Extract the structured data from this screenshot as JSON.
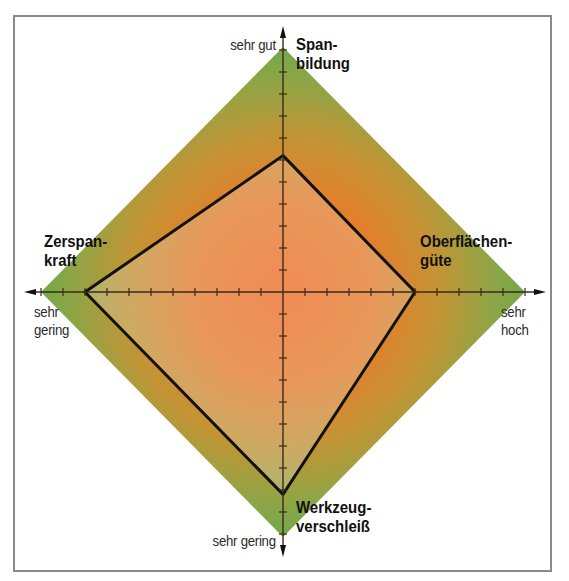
{
  "chart_data": {
    "type": "radar",
    "title": "",
    "scale_max_ticks": 11,
    "axes": [
      {
        "key": "top",
        "name_line1": "Span-",
        "name_line2": "bildung",
        "end_label": "sehr gut",
        "value": 6.2
      },
      {
        "key": "right",
        "name_line1": "Oberflächen-",
        "name_line2": "güte",
        "end_label_line1": "sehr",
        "end_label_line2": "hoch",
        "value": 6.0
      },
      {
        "key": "bottom",
        "name_line1": "Werkzeug-",
        "name_line2": "verschleiß",
        "end_label": "sehr gering",
        "value": 9.2
      },
      {
        "key": "left",
        "name_line1": "Zerspan-",
        "name_line2": "kraft",
        "end_label_line1": "sehr",
        "end_label_line2": "gering",
        "value": 9.0
      }
    ],
    "background": "diamond gradient, orange center to green edge",
    "colors": {
      "center": "#f26a22",
      "mid": "#c9902f",
      "edge": "#72a84a",
      "polygon_stroke": "#111111",
      "polygon_fill_overlay": "rgba(235,225,215,0.28)",
      "axis": "#3a2a1a",
      "frame": "#8a8a8a"
    }
  },
  "labels": {
    "top_end": "sehr gut",
    "top_title_1": "Span-",
    "top_title_2": "bildung",
    "right_title_1": "Oberflächen-",
    "right_title_2": "güte",
    "right_end_1": "sehr",
    "right_end_2": "hoch",
    "left_title_1": "Zerspan-",
    "left_title_2": "kraft",
    "left_end_1": "sehr",
    "left_end_2": "gering",
    "bottom_title_1": "Werkzeug-",
    "bottom_title_2": "verschleiß",
    "bottom_end": "sehr gering"
  }
}
